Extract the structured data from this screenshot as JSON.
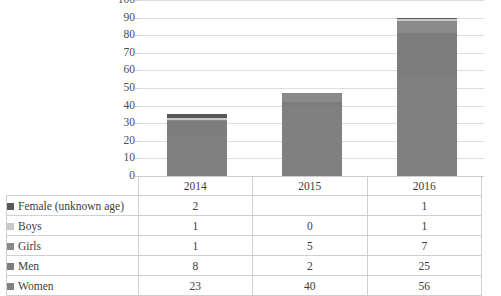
{
  "chart_data": {
    "type": "bar",
    "subtype": "stacked-column-with-data-table",
    "title": "",
    "xlabel": "",
    "ylabel": "",
    "categories": [
      "2014",
      "2015",
      "2016"
    ],
    "ylim": [
      0,
      100
    ],
    "yticks": [
      "0",
      "10",
      "20",
      "30",
      "40",
      "50",
      "60",
      "70",
      "80",
      "90",
      "100"
    ],
    "grid": true,
    "legend_position": "data-table-left",
    "stack_order_bottom_to_top": [
      "Women",
      "Men",
      "Girls",
      "Boys",
      "Female (unknown age)"
    ],
    "series": [
      {
        "name": "Women",
        "color": "#808080",
        "values": [
          23,
          40,
          56
        ],
        "display": [
          "23",
          "40",
          "56"
        ]
      },
      {
        "name": "Men",
        "color": "#7d7d7d",
        "values": [
          8,
          2,
          25
        ],
        "display": [
          "8",
          "2",
          "25"
        ]
      },
      {
        "name": "Girls",
        "color": "#8a8a8a",
        "values": [
          1,
          5,
          7
        ],
        "display": [
          "1",
          "5",
          "7"
        ]
      },
      {
        "name": "Boys",
        "color": "#c9c9c9",
        "values": [
          1,
          0,
          1
        ],
        "display": [
          "1",
          "0",
          "1"
        ]
      },
      {
        "name": "Female (unknown age)",
        "color": "#595959",
        "values": [
          2,
          0,
          1
        ],
        "display": [
          "2",
          "",
          "1"
        ]
      }
    ],
    "totals": [
      35,
      47,
      90
    ]
  },
  "table": {
    "row_header_column_label": "",
    "year_headers": [
      "2014",
      "2015",
      "2016"
    ],
    "rows": [
      {
        "label": "Female (unknown age)",
        "swatch": "#595959",
        "values": [
          "2",
          "",
          "1"
        ]
      },
      {
        "label": "Boys",
        "swatch": "#c9c9c9",
        "values": [
          "1",
          "0",
          "1"
        ]
      },
      {
        "label": "Girls",
        "swatch": "#8a8a8a",
        "values": [
          "1",
          "5",
          "7"
        ]
      },
      {
        "label": "Men",
        "swatch": "#7d7d7d",
        "values": [
          "8",
          "2",
          "25"
        ]
      },
      {
        "label": "Women",
        "swatch": "#808080",
        "values": [
          "23",
          "40",
          "56"
        ]
      }
    ]
  },
  "style": {
    "bar_color": "#808080",
    "grid_color": "#dddddd",
    "table_border_color": "#cfcfcf",
    "text_color": "#3d3d3d",
    "background": "#ffffff"
  }
}
